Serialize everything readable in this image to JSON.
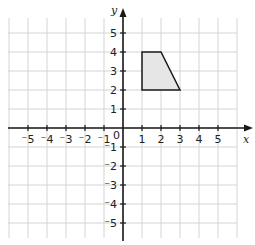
{
  "chart_data": {
    "type": "scatter",
    "title": "",
    "xlabel": "x",
    "ylabel": "y",
    "xlim": [
      -6,
      6
    ],
    "ylim": [
      -6,
      6
    ],
    "grid": true,
    "x_ticks": [
      -5,
      -4,
      -3,
      -2,
      -1,
      1,
      2,
      3,
      4,
      5
    ],
    "y_ticks": [
      -5,
      -4,
      -3,
      -2,
      -1,
      1,
      2,
      3,
      4,
      5
    ],
    "origin_label": "0",
    "polygon": {
      "name": "trapezoid",
      "vertices": [
        [
          1,
          2
        ],
        [
          1,
          4
        ],
        [
          2,
          4
        ],
        [
          3,
          2
        ]
      ],
      "fill": "#e6e6e6",
      "stroke": "#1a1a1a"
    }
  },
  "labels": {
    "x_axis": "x",
    "y_axis": "y",
    "origin": "0"
  }
}
